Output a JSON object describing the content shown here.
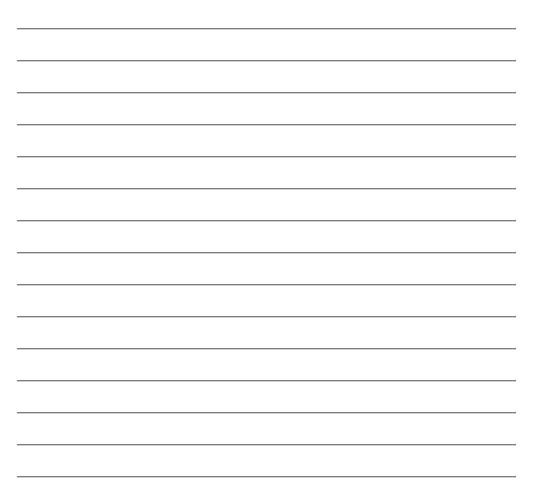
{
  "page": {
    "type": "blank ruled sheet",
    "background_color": "#ffffff",
    "rule_color": "#7c7c7c",
    "rule_count": 15,
    "rule_spacing_px": 32,
    "first_rule_y_px": 28,
    "rule_left_px": 17,
    "rule_right_px": 516,
    "rules": [
      {
        "index": 1,
        "text": ""
      },
      {
        "index": 2,
        "text": ""
      },
      {
        "index": 3,
        "text": ""
      },
      {
        "index": 4,
        "text": ""
      },
      {
        "index": 5,
        "text": ""
      },
      {
        "index": 6,
        "text": ""
      },
      {
        "index": 7,
        "text": ""
      },
      {
        "index": 8,
        "text": ""
      },
      {
        "index": 9,
        "text": ""
      },
      {
        "index": 10,
        "text": ""
      },
      {
        "index": 11,
        "text": ""
      },
      {
        "index": 12,
        "text": ""
      },
      {
        "index": 13,
        "text": ""
      },
      {
        "index": 14,
        "text": ""
      },
      {
        "index": 15,
        "text": ""
      }
    ]
  }
}
